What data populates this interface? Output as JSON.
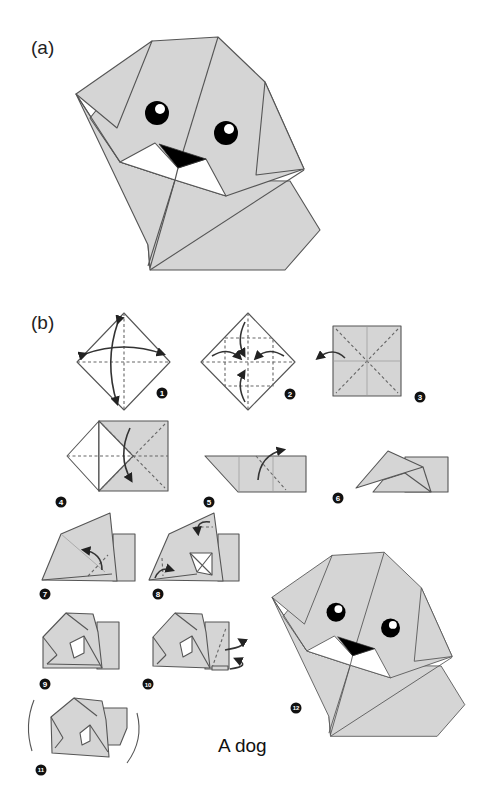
{
  "figure": {
    "panel_a_label": "(a)",
    "panel_b_label": "(b)",
    "caption": "A dog",
    "colors": {
      "paper_fill": "#d5d5d5",
      "outline": "#555555",
      "nose": "#000000",
      "mouth": "#ffffff"
    }
  },
  "steps": [
    {
      "number": "1",
      "icon": "fold-diagonals-diamond"
    },
    {
      "number": "2",
      "icon": "fold-corners-to-center"
    },
    {
      "number": "3",
      "icon": "turn-over-square"
    },
    {
      "number": "4",
      "icon": "fold-in-half"
    },
    {
      "number": "5",
      "icon": "fold-flap-up"
    },
    {
      "number": "6",
      "icon": "folded-ear-shape"
    },
    {
      "number": "7",
      "icon": "fold-corner-inward"
    },
    {
      "number": "8",
      "icon": "fold-ear-and-corner"
    },
    {
      "number": "9",
      "icon": "head-shaped"
    },
    {
      "number": "10",
      "icon": "fold-back-behind"
    },
    {
      "number": "11",
      "icon": "rounded-finish"
    },
    {
      "number": "12",
      "icon": "completed-dog"
    }
  ]
}
